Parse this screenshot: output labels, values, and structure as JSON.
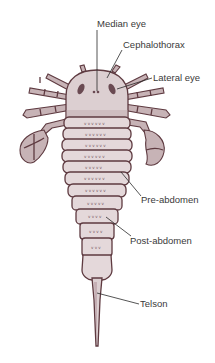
{
  "diagram": {
    "labels": [
      {
        "id": "median-eye",
        "text": "Median eye"
      },
      {
        "id": "cephalothorax",
        "text": "Cephalothorax"
      },
      {
        "id": "lateral-eye",
        "text": "Lateral eye"
      },
      {
        "id": "pre-abdomen",
        "text": "Pre-abdomen"
      },
      {
        "id": "post-abdomen",
        "text": "Post-abdomen"
      },
      {
        "id": "telson",
        "text": "Telson"
      }
    ],
    "colors": {
      "body": "#dccfd1",
      "outline": "#5e3a40",
      "label_text": "#3a3a3a",
      "background": "#ffffff"
    }
  }
}
